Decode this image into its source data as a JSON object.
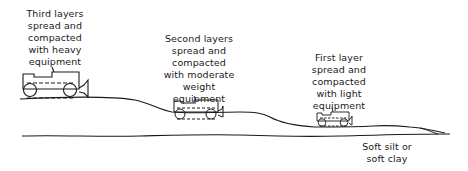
{
  "diagram": {
    "labels": {
      "third_layer": "Third layers\nspread and\ncompacted\nwith heavy\nequipment",
      "second_layer": "Second layers\nspread and\ncompacted\nwith moderate\nweight equipment",
      "first_layer": "First layer\nspread and\ncompacted\nwith light\nequipment",
      "soil": "Soft silt or\nsoft clay"
    },
    "equipment": [
      {
        "name": "heavy-equipment",
        "size": "large"
      },
      {
        "name": "moderate-weight-equipment",
        "size": "medium"
      },
      {
        "name": "light-equipment",
        "size": "small"
      }
    ],
    "colors": {
      "stroke": "#1a1a1a",
      "background": "#ffffff"
    }
  }
}
